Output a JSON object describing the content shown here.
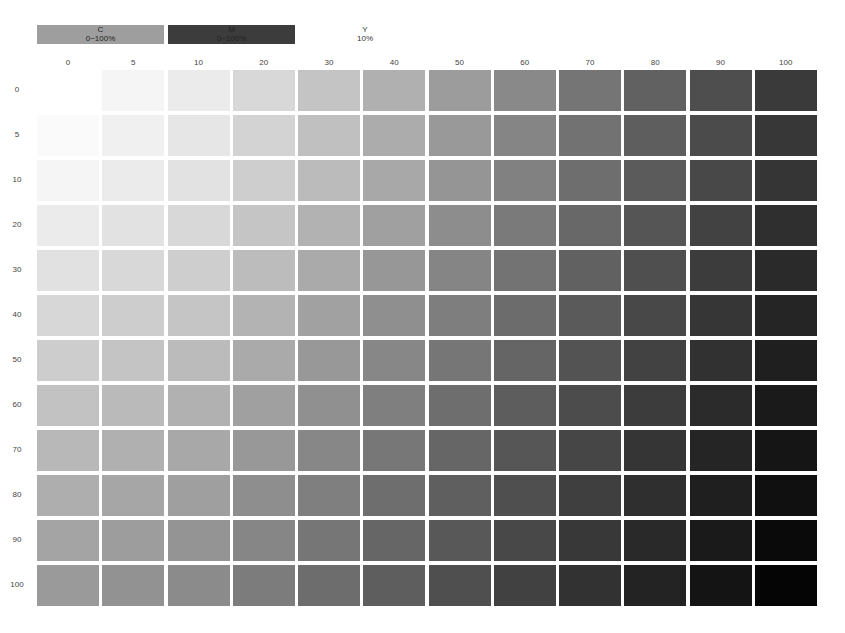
{
  "legend": {
    "c": {
      "name": "C",
      "range": "0~100%",
      "color": "#9e9e9e"
    },
    "m": {
      "name": "M",
      "range": "0~100%",
      "color": "#3c3c3c"
    },
    "y": {
      "name": "Y",
      "range": "10%"
    }
  },
  "columns": [
    "0",
    "5",
    "10",
    "20",
    "30",
    "40",
    "50",
    "60",
    "70",
    "80",
    "90",
    "100"
  ],
  "rows": [
    "0",
    "5",
    "10",
    "20",
    "30",
    "40",
    "50",
    "60",
    "70",
    "80",
    "90",
    "100"
  ],
  "chart_data": {
    "type": "heatmap",
    "xlabel": "M %",
    "ylabel": "C %",
    "x": [
      0,
      5,
      10,
      20,
      30,
      40,
      50,
      60,
      70,
      80,
      90,
      100
    ],
    "y": [
      0,
      5,
      10,
      20,
      30,
      40,
      50,
      60,
      70,
      80,
      90,
      100
    ],
    "fixed": {
      "Y": "10%"
    },
    "value_meaning": "rendered gray level (0=black, 255=white)",
    "values": [
      [
        255,
        245,
        235,
        216,
        196,
        176,
        156,
        137,
        117,
        97,
        78,
        58
      ],
      [
        250,
        240,
        230,
        211,
        192,
        172,
        153,
        133,
        114,
        94,
        75,
        55
      ],
      [
        245,
        235,
        226,
        206,
        187,
        168,
        149,
        129,
        110,
        91,
        72,
        53
      ],
      [
        235,
        226,
        216,
        197,
        178,
        160,
        141,
        122,
        104,
        85,
        66,
        47
      ],
      [
        225,
        216,
        206,
        188,
        170,
        151,
        133,
        115,
        97,
        79,
        60,
        42
      ],
      [
        215,
        205,
        197,
        179,
        161,
        143,
        126,
        108,
        90,
        72,
        54,
        37
      ],
      [
        205,
        196,
        187,
        170,
        152,
        135,
        118,
        101,
        83,
        66,
        49,
        31
      ],
      [
        194,
        186,
        177,
        160,
        144,
        127,
        110,
        93,
        76,
        60,
        43,
        26
      ],
      [
        184,
        176,
        168,
        152,
        135,
        119,
        102,
        86,
        70,
        53,
        37,
        21
      ],
      [
        174,
        166,
        159,
        142,
        127,
        110,
        95,
        79,
        63,
        47,
        31,
        16
      ],
      [
        164,
        157,
        148,
        134,
        118,
        102,
        88,
        72,
        56,
        41,
        26,
        10
      ],
      [
        154,
        146,
        139,
        124,
        109,
        94,
        79,
        65,
        50,
        35,
        20,
        5
      ]
    ],
    "grid": false,
    "legend_position": "top"
  }
}
